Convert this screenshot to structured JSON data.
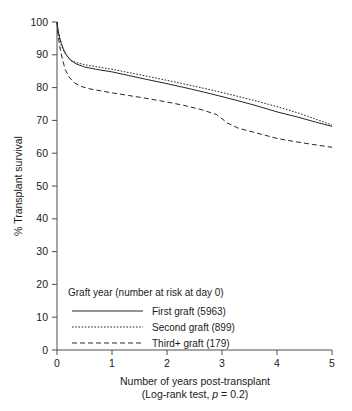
{
  "chart_data": {
    "type": "line",
    "title": "",
    "xlabel": "Number of years post-transplant",
    "ylabel": "% Transplant survival",
    "xlim": [
      0,
      5
    ],
    "ylim": [
      0,
      100
    ],
    "xticks": [
      "0",
      "1",
      "2",
      "3",
      "4",
      "5"
    ],
    "yticks": [
      "0",
      "10",
      "20",
      "30",
      "40",
      "50",
      "60",
      "70",
      "80",
      "90",
      "100"
    ],
    "grid": false,
    "legend_position": "lower-left-inside",
    "legend_title": "Graft year (number at risk at day 0)",
    "annotation": "(Log-rank test, p = 0.2)",
    "annotation_prefix": "(Log-rank test, ",
    "annotation_italic": "p",
    "annotation_suffix": " = 0.2)",
    "series": [
      {
        "name": "First graft (5963)",
        "label": "First graft",
        "n_at_risk": 5963,
        "style": "solid",
        "color": "#262626",
        "x": [
          0,
          0.02,
          0.05,
          0.08,
          0.12,
          0.17,
          0.25,
          0.35,
          0.5,
          0.7,
          1.0,
          1.3,
          1.6,
          2.0,
          2.4,
          2.8,
          3.2,
          3.6,
          4.0,
          4.4,
          4.7,
          5.0
        ],
        "y": [
          100,
          97.5,
          95.2,
          93.4,
          91.6,
          90.0,
          88.3,
          87.2,
          86.3,
          85.6,
          84.8,
          83.7,
          82.6,
          81.2,
          79.7,
          78.1,
          76.4,
          74.6,
          72.6,
          70.9,
          69.5,
          68.2
        ]
      },
      {
        "name": "Second graft (899)",
        "label": "Second graft",
        "n_at_risk": 899,
        "style": "dotted",
        "color": "#262626",
        "x": [
          0,
          0.02,
          0.05,
          0.08,
          0.12,
          0.17,
          0.25,
          0.35,
          0.5,
          0.7,
          1.0,
          1.3,
          1.6,
          2.0,
          2.4,
          2.8,
          3.2,
          3.6,
          4.0,
          4.4,
          4.7,
          5.0
        ],
        "y": [
          100,
          97.0,
          94.6,
          92.8,
          91.2,
          89.8,
          88.4,
          87.6,
          87.0,
          86.4,
          85.6,
          84.6,
          83.6,
          82.2,
          80.8,
          79.3,
          77.7,
          76.0,
          74.2,
          72.2,
          70.4,
          68.6
        ]
      },
      {
        "name": "Third+ graft (179)",
        "label": "Third+ graft",
        "n_at_risk": 179,
        "style": "dashed",
        "color": "#262626",
        "x": [
          0,
          0.02,
          0.05,
          0.1,
          0.15,
          0.22,
          0.32,
          0.45,
          0.6,
          0.8,
          1.0,
          1.3,
          1.6,
          2.0,
          2.3,
          2.6,
          2.9,
          3.1,
          3.3,
          3.6,
          4.0,
          4.3,
          4.6,
          5.0
        ],
        "y": [
          100,
          96.0,
          92.5,
          88.5,
          85.5,
          83.2,
          81.4,
          80.3,
          79.6,
          79.0,
          78.4,
          77.6,
          76.8,
          75.6,
          74.6,
          73.4,
          71.8,
          69.2,
          67.6,
          66.3,
          64.5,
          63.6,
          62.8,
          61.8
        ]
      }
    ]
  },
  "legend": {
    "title": "Graft year (number at risk at day 0)",
    "entries": [
      {
        "label": "First graft (5963)",
        "style": "solid"
      },
      {
        "label": "Second graft (899)",
        "style": "dotted"
      },
      {
        "label": "Third+ graft (179)",
        "style": "dashed"
      }
    ]
  }
}
